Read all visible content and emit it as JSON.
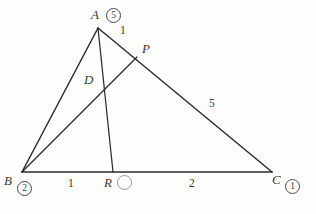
{
  "figure": {
    "type": "geometry-diagram",
    "stroke_color": "#2b2b2b",
    "background_color": "#fdfdfc",
    "points": {
      "A": {
        "label": "A",
        "x": 98,
        "y": 28
      },
      "B": {
        "label": "B",
        "x": 22,
        "y": 172
      },
      "C": {
        "label": "C",
        "x": 272,
        "y": 172
      },
      "P": {
        "label": "P",
        "x": 137,
        "y": 57
      },
      "R": {
        "label": "R",
        "x": 113,
        "y": 172
      },
      "D": {
        "label": "D",
        "x": 103,
        "y": 87
      }
    },
    "segments": [
      {
        "name": "AB",
        "from": "A",
        "to": "B"
      },
      {
        "name": "AC",
        "from": "A",
        "to": "C"
      },
      {
        "name": "BC",
        "from": "B",
        "to": "C"
      },
      {
        "name": "AR",
        "from": "A",
        "to": "R"
      },
      {
        "name": "BP",
        "from": "B",
        "to": "P"
      }
    ],
    "segment_labels": {
      "AP": "1",
      "PC": "5",
      "BR": "1",
      "RC": "2"
    },
    "vertex_marks": {
      "A": "5",
      "B": "2",
      "C": "1",
      "R": ""
    }
  }
}
